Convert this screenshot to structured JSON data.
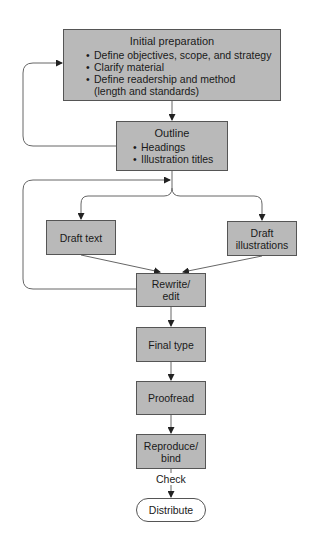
{
  "nodes": {
    "initial": {
      "title": "Initial preparation",
      "bullets": [
        "Define objectives, scope, and strategy",
        "Clarify material",
        "Define readership and method",
        "(length and standards)"
      ]
    },
    "outline": {
      "title": "Outline",
      "bullets": [
        "Headings",
        "Illustration titles"
      ]
    },
    "draft_text": {
      "label": "Draft text"
    },
    "draft_illustrations": {
      "line1": "Draft",
      "line2": "illustrations"
    },
    "rewrite": {
      "line1": "Rewrite/",
      "line2": "edit"
    },
    "final_type": {
      "label": "Final type"
    },
    "proofread": {
      "label": "Proofread"
    },
    "reproduce": {
      "line1": "Reproduce/",
      "line2": "bind"
    },
    "distribute": {
      "label": "Distribute"
    }
  },
  "edge_labels": {
    "check": "Check"
  },
  "colors": {
    "box_fill": "#b9b9b9",
    "line": "#555555"
  }
}
